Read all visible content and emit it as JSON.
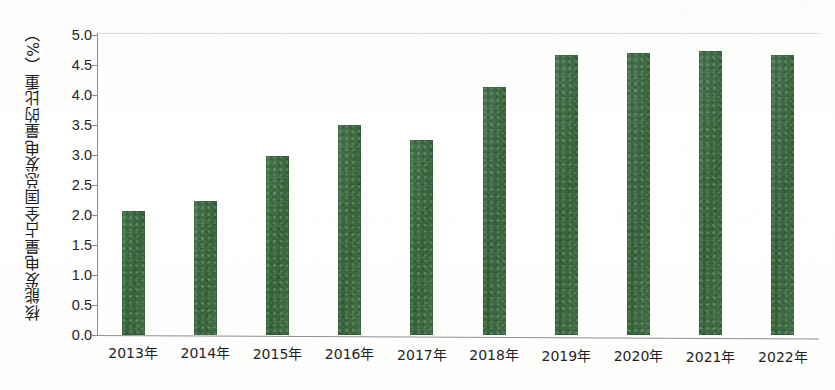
{
  "chart_data": {
    "type": "bar",
    "title": "",
    "subtitle": "",
    "xlabel": "",
    "ylabel": "核能发电量占全国总发电量的比重（%）",
    "categories": [
      "2013年",
      "2014年",
      "2015年",
      "2016年",
      "2017年",
      "2018年",
      "2019年",
      "2020年",
      "2021年",
      "2022年"
    ],
    "values": [
      2.07,
      2.24,
      2.98,
      3.5,
      3.25,
      4.13,
      4.66,
      4.7,
      4.74,
      4.67
    ],
    "series": [
      {
        "name": "核能发电量占全国总发电量的比重",
        "values": [
          2.07,
          2.24,
          2.98,
          3.5,
          3.25,
          4.13,
          4.66,
          4.7,
          4.74,
          4.67
        ],
        "color": "#3a6b40"
      }
    ],
    "ylim": [
      0.0,
      5.0
    ],
    "ytick_values": [
      0.0,
      0.5,
      1.0,
      1.5,
      2.0,
      2.5,
      3.0,
      3.5,
      4.0,
      4.5,
      5.0
    ],
    "ytick_labels": [
      "0.0",
      "0.5",
      "1.0",
      "1.5",
      "2.0",
      "2.5",
      "3.0",
      "3.5",
      "4.0",
      "4.5",
      "5.0"
    ],
    "grid": false,
    "legend": false,
    "legend_position": "none",
    "bar_color": "#3a6b40",
    "background_color": "#fdfdfc",
    "axis_color": "#8d8d8d",
    "annotations": []
  }
}
